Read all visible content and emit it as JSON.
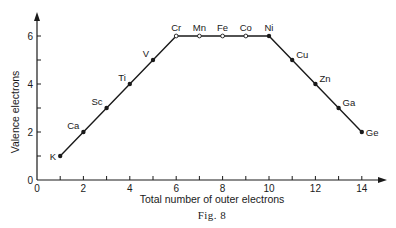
{
  "chart_data": {
    "type": "line",
    "title": "",
    "caption": "Fig. 8",
    "xlabel": "Total number of outer electrons",
    "ylabel": "Valence electrons",
    "xlim": [
      0,
      15
    ],
    "ylim": [
      0,
      7
    ],
    "xticks": [
      0,
      2,
      4,
      6,
      8,
      10,
      12,
      14
    ],
    "yticks": [
      0,
      2,
      4,
      6
    ],
    "x_minor_ticks": [
      1,
      3,
      5,
      7,
      9,
      11,
      13
    ],
    "y_minor_ticks": [
      1,
      3,
      5
    ],
    "grid": false,
    "legend": null,
    "series": [
      {
        "name": "Valence electrons",
        "points": [
          {
            "label": "K",
            "x": 1,
            "y": 1,
            "marker": "filled"
          },
          {
            "label": "Ca",
            "x": 2,
            "y": 2,
            "marker": "filled"
          },
          {
            "label": "Sc",
            "x": 3,
            "y": 3,
            "marker": "filled"
          },
          {
            "label": "Ti",
            "x": 4,
            "y": 4,
            "marker": "filled"
          },
          {
            "label": "V",
            "x": 5,
            "y": 5,
            "marker": "filled"
          },
          {
            "label": "Cr",
            "x": 6,
            "y": 6,
            "marker": "open"
          },
          {
            "label": "Mn",
            "x": 7,
            "y": 6,
            "marker": "open"
          },
          {
            "label": "Fe",
            "x": 8,
            "y": 6,
            "marker": "open"
          },
          {
            "label": "Co",
            "x": 9,
            "y": 6,
            "marker": "open"
          },
          {
            "label": "Ni",
            "x": 10,
            "y": 6,
            "marker": "filled"
          },
          {
            "label": "Cu",
            "x": 11,
            "y": 5,
            "marker": "filled"
          },
          {
            "label": "Zn",
            "x": 12,
            "y": 4,
            "marker": "filled"
          },
          {
            "label": "Ga",
            "x": 13,
            "y": 3,
            "marker": "filled"
          },
          {
            "label": "Ge",
            "x": 14,
            "y": 2,
            "marker": "filled"
          }
        ]
      }
    ]
  }
}
